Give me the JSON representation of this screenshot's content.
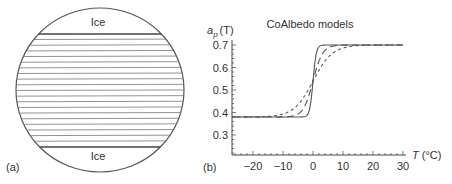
{
  "panel_a": {
    "label": "(a)",
    "ice_top_label": "Ice",
    "ice_bottom_label": "Ice",
    "band_line_count": 20
  },
  "panel_b": {
    "label": "(b)",
    "title": "CoAlbedo models",
    "ylabel_main": "a",
    "ylabel_sub": "p",
    "ylabel_arg": "(T)",
    "xlabel": "T (°C)",
    "xlabel_var": "T",
    "xlabel_unit": " (°C)"
  },
  "chart_data": {
    "type": "line",
    "title": "CoAlbedo models",
    "xlabel": "T (°C)",
    "ylabel": "a_p (T)",
    "xlim": [
      -28,
      30
    ],
    "ylim": [
      0.2,
      0.72
    ],
    "xticks": [
      -20,
      -10,
      0,
      10,
      20,
      30
    ],
    "xtick_labels": [
      "−20",
      "−10",
      "0",
      "10",
      "20",
      "30"
    ],
    "yticks": [
      0.3,
      0.4,
      0.5,
      0.6,
      0.7
    ],
    "ytick_labels": [
      "0.3",
      "0.4",
      "0.5",
      "0.6",
      "0.7"
    ],
    "grid": false,
    "legend": null,
    "series": [
      {
        "name": "steep (solid)",
        "style": "solid",
        "low": 0.38,
        "high": 0.7,
        "center": 0,
        "width": 1.2
      },
      {
        "name": "medium (long dash)",
        "style": "long-dash",
        "low": 0.38,
        "high": 0.7,
        "center": 0,
        "width": 3.5
      },
      {
        "name": "smooth (short dash)",
        "style": "short-dash",
        "low": 0.38,
        "high": 0.7,
        "center": 0,
        "width": 7
      }
    ]
  }
}
